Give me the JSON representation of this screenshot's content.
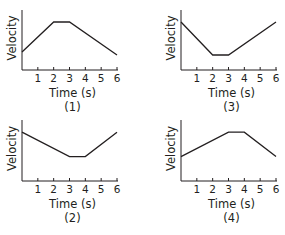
{
  "chart_data": [
    {
      "id": "chart-1",
      "type": "line",
      "panel_label": "(1)",
      "xlabel": "Time (s)",
      "ylabel": "Velocity",
      "x_ticks": [
        "1",
        "2",
        "3",
        "4",
        "5",
        "6"
      ],
      "xlim": [
        0,
        6
      ],
      "ylim": [
        0,
        10
      ],
      "grid": false,
      "x": [
        0,
        2,
        3,
        6
      ],
      "values": [
        3,
        8,
        8,
        2.5
      ],
      "description": "Velocity increases from t=0 to t=2 s, constant from 2 to 3 s, decreases from 3 to 6 s"
    },
    {
      "id": "chart-2",
      "type": "line",
      "panel_label": "(2)",
      "xlabel": "Time (s)",
      "ylabel": "Velocity",
      "x_ticks": [
        "1",
        "2",
        "3",
        "4",
        "5",
        "6"
      ],
      "xlim": [
        0,
        6
      ],
      "ylim": [
        0,
        10
      ],
      "grid": false,
      "x": [
        0,
        3,
        4,
        6
      ],
      "values": [
        8,
        4,
        4,
        8
      ],
      "description": "Velocity decreases from t=0 to t=3 s, constant from 3 to 4 s, increases from 4 to 6 s"
    },
    {
      "id": "chart-3",
      "type": "line",
      "panel_label": "(3)",
      "xlabel": "Time (s)",
      "ylabel": "Velocity",
      "x_ticks": [
        "1",
        "2",
        "3",
        "4",
        "5",
        "6"
      ],
      "xlim": [
        0,
        6
      ],
      "ylim": [
        0,
        10
      ],
      "grid": false,
      "x": [
        0,
        2,
        3,
        6
      ],
      "values": [
        8,
        2.5,
        2.5,
        8
      ],
      "description": "Velocity decreases from t=0 to t=2 s, constant from 2 to 3 s, increases from 3 to 6 s"
    },
    {
      "id": "chart-4",
      "type": "line",
      "panel_label": "(4)",
      "xlabel": "Time (s)",
      "ylabel": "Velocity",
      "x_ticks": [
        "1",
        "2",
        "3",
        "4",
        "5",
        "6"
      ],
      "xlim": [
        0,
        6
      ],
      "ylim": [
        0,
        10
      ],
      "grid": false,
      "x": [
        0,
        3,
        4,
        6
      ],
      "values": [
        4,
        8,
        8,
        4
      ],
      "description": "Velocity increases from t=0 to t=3 s, constant from 3 to 4 s, decreases from 4 to 6 s"
    }
  ],
  "labels": {
    "xlabel": "Time (s)",
    "ylabel": "Velocity",
    "ticks": [
      "1",
      "2",
      "3",
      "4",
      "5",
      "6"
    ],
    "panels": [
      "(1)",
      "(2)",
      "(3)",
      "(4)"
    ]
  }
}
